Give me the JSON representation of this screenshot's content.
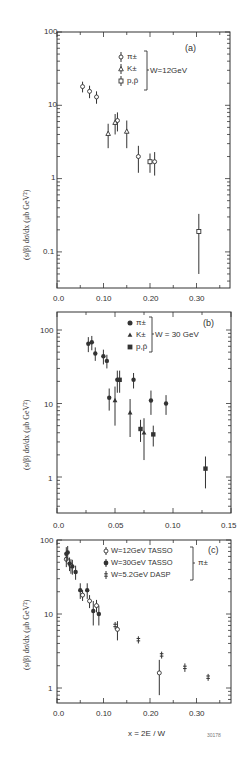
{
  "figure_id": "30178",
  "x_axis_label": "x = 2E / W",
  "chart_data": [
    {
      "type": "scatter",
      "panel": "(a)",
      "title": "",
      "xlabel": "",
      "ylabel": "(s/β) dσ/dx  (μb GeV²)",
      "yscale": "log",
      "xlim": [
        0.0,
        0.37
      ],
      "ylim": [
        0.04,
        100
      ],
      "xticks": [
        "0.0",
        "0.10",
        "0.20",
        "0.30"
      ],
      "yticks": [
        "100",
        "10",
        "1",
        "0.1"
      ],
      "legend": {
        "entries": [
          "π±",
          "K±",
          "p,p̄"
        ],
        "group_label": "W=12GeV",
        "position": "upper right"
      },
      "annotation": "(a)",
      "series": [
        {
          "name": "π±",
          "marker": "open-circle",
          "points": [
            [
              0.055,
              18,
              3
            ],
            [
              0.07,
              15.5,
              3
            ],
            [
              0.085,
              13,
              2.5
            ],
            [
              0.13,
              6.2,
              1.8
            ],
            [
              0.175,
              2.0,
              0.8
            ],
            [
              0.21,
              1.7,
              0.6
            ]
          ]
        },
        {
          "name": "K±",
          "marker": "open-triangle",
          "points": [
            [
              0.11,
              4.1,
              1.5
            ],
            [
              0.125,
              5.8,
              1.8
            ],
            [
              0.15,
              4.4,
              1.8
            ]
          ]
        },
        {
          "name": "p,p̄",
          "marker": "open-square",
          "points": [
            [
              0.2,
              1.7,
              0.5
            ],
            [
              0.305,
              0.19,
              0.14
            ]
          ]
        }
      ]
    },
    {
      "type": "scatter",
      "panel": "(b)",
      "xlabel": "",
      "ylabel": "(s/β) dσ/dx  (μb GeV²)",
      "yscale": "log",
      "xlim": [
        0.0,
        0.15
      ],
      "ylim": [
        0.4,
        200
      ],
      "xticks": [
        "0.0",
        "0.05",
        "0.10",
        "0.15"
      ],
      "yticks": [
        "100",
        "10",
        "1"
      ],
      "legend": {
        "entries": [
          "π±",
          "K±",
          "p,p̄"
        ],
        "group_label": "W = 30 GeV",
        "position": "upper right"
      },
      "annotation": "(b)",
      "series": [
        {
          "name": "π±",
          "marker": "filled-circle",
          "points": [
            [
              0.027,
              65,
              15
            ],
            [
              0.03,
              68,
              15
            ],
            [
              0.033,
              48,
              10
            ],
            [
              0.04,
              44,
              10
            ],
            [
              0.043,
              38,
              8
            ],
            [
              0.045,
              12,
              4
            ],
            [
              0.052,
              21,
              7
            ],
            [
              0.066,
              21,
              5
            ],
            [
              0.081,
              11,
              4
            ],
            [
              0.094,
              10,
              3
            ]
          ]
        },
        {
          "name": "K±",
          "marker": "filled-triangle",
          "points": [
            [
              0.05,
              11,
              6
            ],
            [
              0.063,
              7.5,
              4
            ],
            [
              0.075,
              4,
              2.3
            ]
          ]
        },
        {
          "name": "p,p̄",
          "marker": "filled-square",
          "points": [
            [
              0.054,
              21,
              7
            ],
            [
              0.072,
              4.5,
              1.5
            ],
            [
              0.083,
              3.8,
              1.2
            ],
            [
              0.128,
              1.3,
              0.6
            ]
          ]
        }
      ]
    },
    {
      "type": "scatter",
      "panel": "(c)",
      "xlabel": "x = 2E / W",
      "ylabel": "(s/β) dσ/dx  (μb GeV²)",
      "yscale": "log",
      "xlim": [
        0.0,
        0.37
      ],
      "ylim": [
        0.7,
        100
      ],
      "xticks": [
        "0.0",
        "0.10",
        "0.20",
        "0.30"
      ],
      "yticks": [
        "100",
        "10",
        "1"
      ],
      "legend": {
        "entries": [
          "W=12GeV TASSO",
          "W=30GeV TASSO",
          "W=5.2GeV DASP"
        ],
        "group_label": "π±",
        "position": "upper right"
      },
      "annotation": "(c)",
      "series": [
        {
          "name": "W=12GeV TASSO",
          "marker": "open-circle",
          "points": [
            [
              0.02,
              55,
              12
            ],
            [
              0.03,
              45,
              10
            ],
            [
              0.055,
              18,
              3
            ],
            [
              0.07,
              15,
              3
            ],
            [
              0.085,
              13,
              2.5
            ],
            [
              0.13,
              6.2,
              1.8
            ],
            [
              0.22,
              1.6,
              0.8
            ]
          ]
        },
        {
          "name": "W=30GeV TASSO",
          "marker": "filled-circle",
          "points": [
            [
              0.02,
              65,
              15
            ],
            [
              0.023,
              68,
              15
            ],
            [
              0.027,
              48,
              10
            ],
            [
              0.033,
              44,
              10
            ],
            [
              0.04,
              37,
              8
            ],
            [
              0.05,
              21,
              5
            ],
            [
              0.065,
              21,
              5
            ],
            [
              0.078,
              11,
              4
            ],
            [
              0.09,
              10,
              3
            ]
          ]
        },
        {
          "name": "W=5.2GeV DASP",
          "marker": "cross",
          "points": [
            [
              0.125,
              7,
              0.8
            ],
            [
              0.175,
              4.5,
              0.5
            ],
            [
              0.225,
              2.8,
              0.3
            ],
            [
              0.275,
              1.9,
              0.25
            ],
            [
              0.325,
              1.4,
              0.15
            ]
          ]
        }
      ]
    }
  ],
  "panels": {
    "a": {
      "tag": "(a)",
      "group": "W=12GeV",
      "legend": [
        "π±",
        "K±",
        "p,p̄"
      ],
      "xticks": [
        "0.0",
        "0.10",
        "0.20",
        "0.30"
      ],
      "yticks": [
        "100",
        "10",
        "1",
        "0.1"
      ]
    },
    "b": {
      "tag": "(b)",
      "group": "W = 30 GeV",
      "legend": [
        "π±",
        "K±",
        "p,p̄"
      ],
      "xticks": [
        "0.0",
        "0.05",
        "0.10",
        "0.15"
      ],
      "yticks": [
        "100",
        "10",
        "1"
      ]
    },
    "c": {
      "tag": "(c)",
      "group": "π±",
      "legend": [
        "W=12GeV TASSO",
        "W=30GeV TASSO",
        "W=5.2GeV DASP"
      ],
      "xticks": [
        "0.0",
        "0.10",
        "0.20",
        "0.30"
      ],
      "yticks": [
        "100",
        "10",
        "1"
      ]
    }
  },
  "ylabel_a": "(s/β) dσ/dx   (μb GeV²)",
  "ylabel_b": "(s/β) dσ/dx   (μb GeV²)",
  "ylabel_c": "(s/β) dσ/dx   (μb GeV²)"
}
